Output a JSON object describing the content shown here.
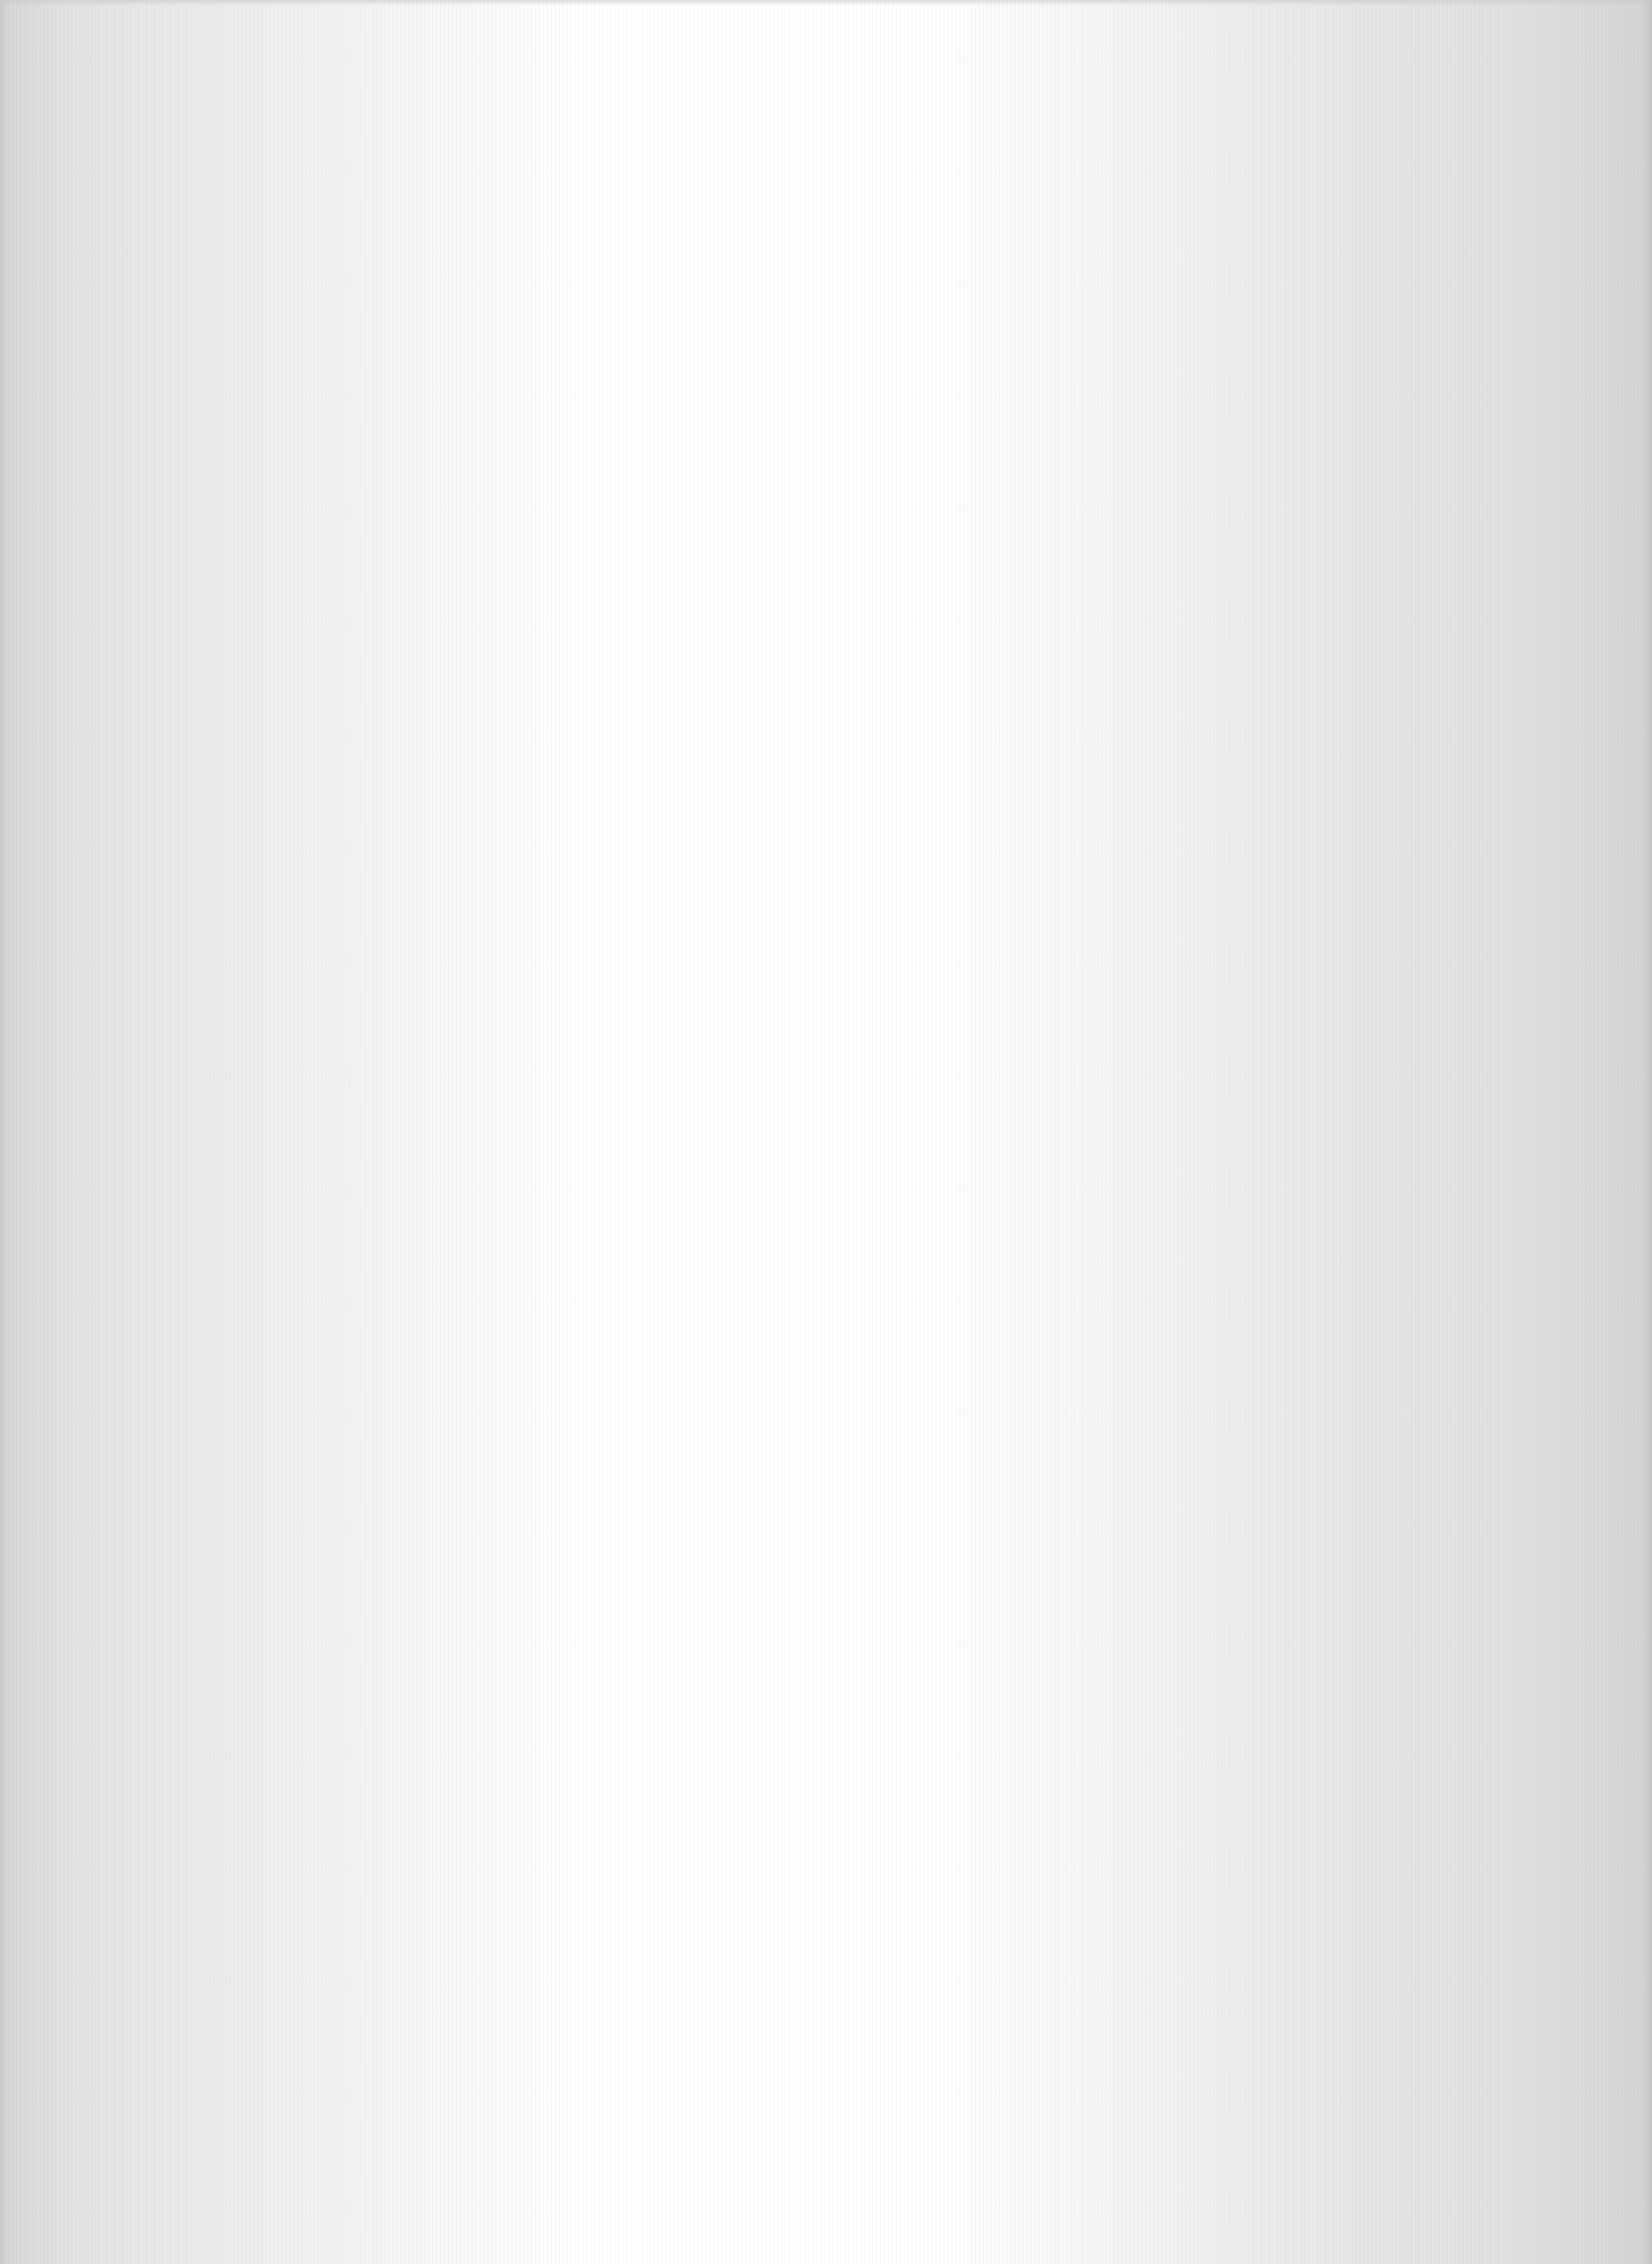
{
  "document": {
    "type": "blank-scanned-page",
    "text_content": "",
    "colors": {
      "edge": "#d6d6d6",
      "center": "#ffffff"
    }
  }
}
